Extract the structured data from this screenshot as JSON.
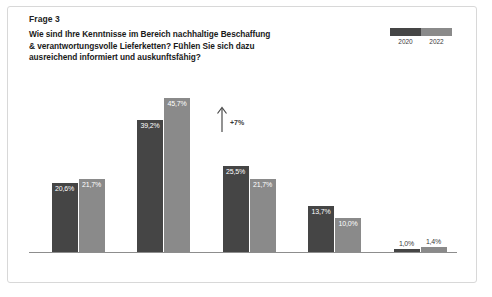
{
  "card": {
    "frage_label": "Frage 3",
    "question_line1": "Wie sind Ihre Kenntnisse im Bereich nachhaltige Beschaffung",
    "question_line2": "& verantwortungsvolle Lieferketten? Fühlen Sie sich dazu",
    "question_line3": "ausreichend informiert und auskunftsfähig?"
  },
  "legend": {
    "entries": [
      {
        "label": "2020",
        "color": "#454545"
      },
      {
        "label": "2022",
        "color": "#8a8a8a"
      }
    ]
  },
  "annotation": {
    "arrow": "up-arrow",
    "delta_label": "+7%"
  },
  "chart_data": {
    "type": "bar",
    "title": "Wie sind Ihre Kenntnisse im Bereich nachhaltige Beschaffung & verantwortungsvolle Lieferketten? Fühlen Sie sich dazu ausreichend informiert und auskunftsfähig?",
    "xlabel": "",
    "ylabel": "",
    "ylim": [
      0,
      50
    ],
    "grid": false,
    "legend_position": "top-right",
    "categories": [
      "sehr gute",
      "grundlegende",
      "teils/teils",
      "kaum",
      "gar keine"
    ],
    "series": [
      {
        "name": "2020",
        "color": "#454545",
        "values": [
          20.6,
          39.2,
          25.5,
          13.7,
          1.0
        ],
        "labels": [
          "20,6%",
          "39,2%",
          "25,5%",
          "13,7%",
          "1,0%"
        ]
      },
      {
        "name": "2022",
        "color": "#8a8a8a",
        "values": [
          21.7,
          45.7,
          21.7,
          10.0,
          1.4
        ],
        "labels": [
          "21,7%",
          "45,7%",
          "21,7%",
          "10,0%",
          "1,4%"
        ]
      }
    ],
    "annotations": [
      {
        "text": "+7%",
        "target_category": "grundlegende",
        "direction": "up"
      }
    ]
  }
}
